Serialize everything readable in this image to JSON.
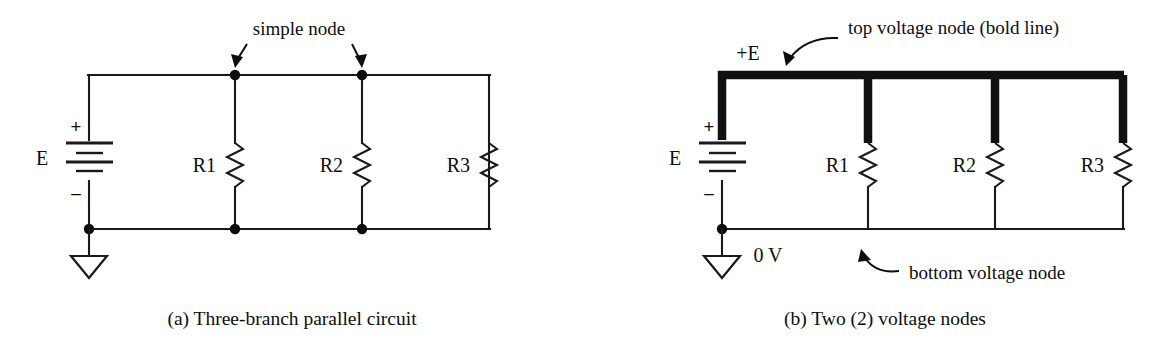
{
  "figure": {
    "background_color": "#ffffff",
    "ink_color": "#0d0d0d",
    "panels": [
      {
        "id": "a",
        "caption": "(a) Three-branch parallel circuit",
        "source_label": "E",
        "plus_sign": "+",
        "minus_sign": "–",
        "resistors": [
          "R1",
          "R2",
          "R3"
        ],
        "annotation": "simple node",
        "annotation_arrow_count": 2,
        "node_dot_count": 5,
        "ground_symbol": "earth-triangle"
      },
      {
        "id": "b",
        "caption": "(b) Two (2) voltage nodes",
        "source_label": "E",
        "plus_sign": "+",
        "minus_sign": "–",
        "resistors": [
          "R1",
          "R2",
          "R3"
        ],
        "top_node_label": "+E",
        "bottom_node_label": "0 V",
        "annotation_top": "top voltage node (bold line)",
        "annotation_bottom": "bottom voltage node",
        "node_dot_count": 1,
        "ground_symbol": "earth-triangle",
        "bold_line_color": "#111111"
      }
    ]
  }
}
